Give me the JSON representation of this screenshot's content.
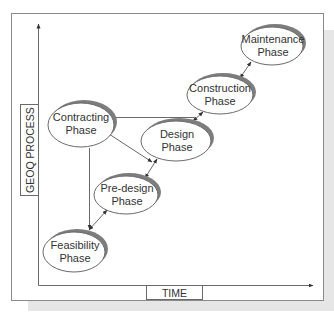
{
  "diagram": {
    "colors": {
      "frame": "#8a8a8a",
      "shadow": "#e6e6e6",
      "ellipse_fill": "#ffffff",
      "ellipse_stroke": "#6a6a6a",
      "ellipse_shadow": "#7d7d7d",
      "line": "#6a6a6a",
      "text": "#333333"
    },
    "axes": {
      "y_label": "GEOQ PROCESS",
      "x_label": "TIME"
    },
    "nodes": [
      {
        "id": "contracting",
        "line1": "Contracting",
        "line2": "Phase"
      },
      {
        "id": "feasibility",
        "line1": "Feasibility",
        "line2": "Phase"
      },
      {
        "id": "predesign",
        "line1": "Pre-design",
        "line2": "Phase"
      },
      {
        "id": "design",
        "line1": "Design",
        "line2": "Phase"
      },
      {
        "id": "construction",
        "line1": "Construction",
        "line2": "Phase"
      },
      {
        "id": "maintenance",
        "line1": "Maintenance",
        "line2": "Phase"
      }
    ],
    "edges": [
      {
        "from": "contracting",
        "to": "feasibility",
        "type": "arrow"
      },
      {
        "from": "contracting",
        "to": "design",
        "type": "arrow"
      },
      {
        "from": "contracting",
        "to": "construction",
        "type": "arrow"
      },
      {
        "from": "feasibility",
        "to": "predesign",
        "type": "double-arrow"
      },
      {
        "from": "predesign",
        "to": "design",
        "type": "double-arrow"
      },
      {
        "from": "design",
        "to": "construction",
        "type": "double-arrow"
      },
      {
        "from": "construction",
        "to": "maintenance",
        "type": "double-arrow"
      }
    ]
  }
}
